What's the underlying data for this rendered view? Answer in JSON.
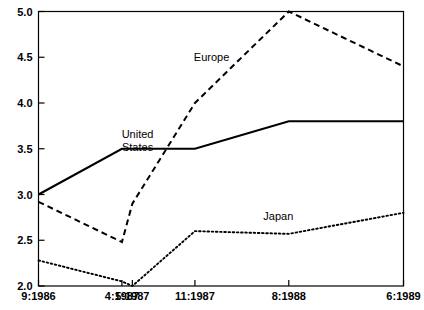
{
  "chart_data": {
    "type": "line",
    "title": "",
    "subtitle": "",
    "xlabel": "",
    "ylabel": "",
    "x": [
      "9:1986",
      "4:1987",
      "5:1987",
      "11:1987",
      "8:1988",
      "6:1989"
    ],
    "categories": [
      "9:1986",
      "4:1987",
      "5:1987",
      "11:1987",
      "8:1988",
      "6:1989"
    ],
    "x_positions": [
      0,
      8,
      9,
      15,
      24,
      35
    ],
    "xlim": [
      0,
      35
    ],
    "ylim": [
      2.0,
      5.0
    ],
    "yticks": [
      "2.0",
      "2.5",
      "3.0",
      "3.5",
      "4.0",
      "4.5",
      "5.0"
    ],
    "ytick_values": [
      2.0,
      2.5,
      3.0,
      3.5,
      4.0,
      4.5,
      5.0
    ],
    "grid": false,
    "legend_position": "inline-annotations",
    "series": [
      {
        "name": "United States",
        "style": "solid",
        "values": [
          3.0,
          3.5,
          3.5,
          3.5,
          3.8,
          3.8
        ]
      },
      {
        "name": "Europe",
        "style": "dashed",
        "values": [
          2.92,
          2.48,
          2.9,
          4.0,
          5.0,
          4.4
        ]
      },
      {
        "name": "Japan",
        "style": "dotted",
        "values": [
          2.28,
          2.05,
          2.0,
          2.6,
          2.57,
          2.8
        ]
      }
    ],
    "annotations": [
      {
        "text": "United",
        "x": 9.5,
        "y": 3.62,
        "series": "United States"
      },
      {
        "text": "States",
        "x": 9.5,
        "y": 3.47,
        "series": "United States"
      },
      {
        "text": "Europe",
        "x": 16.6,
        "y": 4.46,
        "series": "Europe"
      },
      {
        "text": "Japan",
        "x": 23.0,
        "y": 2.72,
        "series": "Japan"
      }
    ]
  },
  "colors": {
    "background": "#ffffff",
    "axis": "#000000",
    "series": "#000000"
  }
}
